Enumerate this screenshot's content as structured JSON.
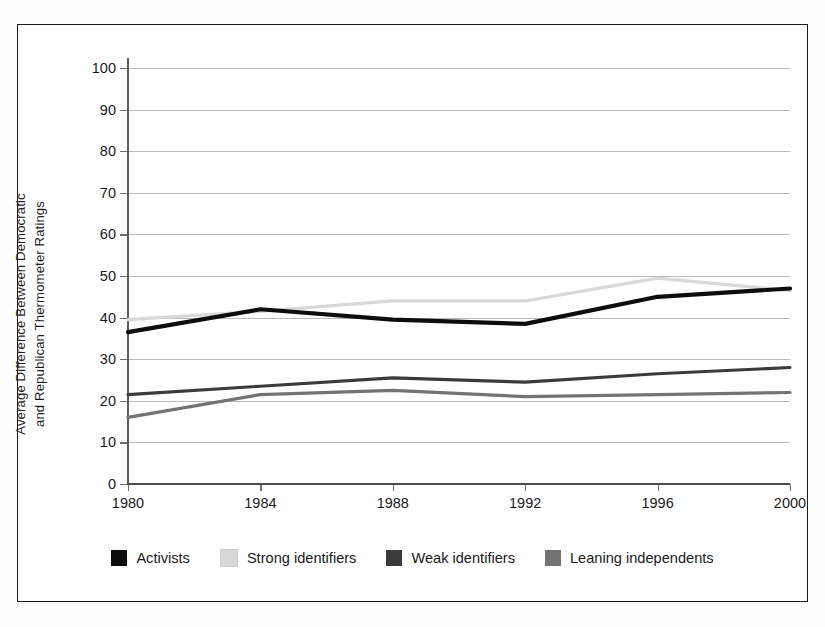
{
  "chart_data": {
    "type": "line",
    "title": "",
    "xlabel": "",
    "ylabel": "Average Difference Between Democratic\nand Republican Thermometer Ratings",
    "categories": [
      "1980",
      "1984",
      "1988",
      "1992",
      "1996",
      "2000"
    ],
    "x": [
      1980,
      1984,
      1988,
      1992,
      1996,
      2000
    ],
    "ylim": [
      0,
      100
    ],
    "yticks": [
      0,
      10,
      20,
      30,
      40,
      50,
      60,
      70,
      80,
      90,
      100
    ],
    "ytick_labels": [
      "0",
      "10",
      "20",
      "30",
      "40",
      "50",
      "60",
      "70",
      "80",
      "90",
      "100"
    ],
    "grid": true,
    "legend_position": "bottom",
    "series": [
      {
        "name": "Activists",
        "color": "#0d0d0d",
        "values": [
          36.5,
          42.0,
          39.5,
          38.5,
          45.0,
          47.0
        ]
      },
      {
        "name": "Strong identifiers",
        "color": "#d8d8d8",
        "values": [
          39.5,
          41.5,
          44.0,
          44.0,
          49.5,
          46.5
        ]
      },
      {
        "name": "Weak identifiers",
        "color": "#3b3b3b",
        "values": [
          21.5,
          23.5,
          25.5,
          24.5,
          26.5,
          28.0
        ]
      },
      {
        "name": "Leaning independents",
        "color": "#737373",
        "values": [
          16.0,
          21.5,
          22.5,
          21.0,
          21.5,
          22.0
        ]
      }
    ]
  },
  "legend": {
    "items": [
      {
        "label": "Activists",
        "color": "#0d0d0d"
      },
      {
        "label": "Strong identifiers",
        "color": "#d8d8d8"
      },
      {
        "label": "Weak identifiers",
        "color": "#3b3b3b"
      },
      {
        "label": "Leaning independents",
        "color": "#737373"
      }
    ]
  },
  "axis": {
    "y_title": "Average Difference Between Democratic\nand Republican Thermometer Ratings"
  }
}
